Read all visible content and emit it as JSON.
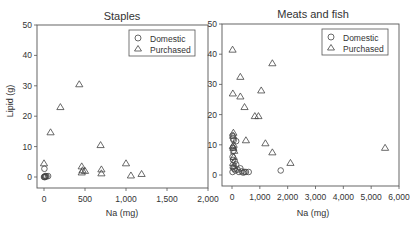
{
  "chart_data": [
    {
      "type": "scatter",
      "title": "Staples",
      "xlabel": "Na (mg)",
      "ylabel": "Lipid (g)",
      "xlim": [
        0,
        2000
      ],
      "ylim": [
        0,
        50
      ],
      "xticks": [
        "0",
        "500",
        "1,000",
        "1,500",
        "2,000"
      ],
      "yticks": [
        "0",
        "10",
        "20",
        "30",
        "40",
        "50"
      ],
      "grid": false,
      "legend": {
        "position": "upper right",
        "entries": [
          "Domestic",
          "Purchased"
        ]
      },
      "series": [
        {
          "name": "Domestic",
          "marker": "circle",
          "points": [
            [
              0,
              0
            ],
            [
              5,
              0
            ],
            [
              10,
              0.2
            ],
            [
              15,
              0
            ],
            [
              20,
              0.3
            ],
            [
              30,
              0.2
            ],
            [
              50,
              0.3
            ],
            [
              5,
              2.7
            ]
          ]
        },
        {
          "name": "Purchased",
          "marker": "triangle",
          "points": [
            [
              0,
              4.5
            ],
            [
              80,
              14.7
            ],
            [
              200,
              23
            ],
            [
              430,
              30.5
            ],
            [
              460,
              3.5
            ],
            [
              460,
              1.5
            ],
            [
              470,
              2.2
            ],
            [
              500,
              2
            ],
            [
              690,
              10.5
            ],
            [
              700,
              2.5
            ],
            [
              700,
              1.2
            ],
            [
              1000,
              4.5
            ],
            [
              1060,
              0.5
            ],
            [
              1190,
              1
            ]
          ]
        }
      ]
    },
    {
      "type": "scatter",
      "title": "Meats and fish",
      "xlabel": "Na (mg)",
      "ylabel": "",
      "xlim": [
        0,
        6000
      ],
      "ylim": [
        0,
        50
      ],
      "xticks": [
        "0",
        "1,000",
        "2,000",
        "3,000",
        "4,000",
        "5,000",
        "6,000"
      ],
      "yticks": [
        "0",
        "10",
        "20",
        "30",
        "40",
        "50"
      ],
      "grid": false,
      "legend": {
        "position": "upper right",
        "entries": [
          "Domestic",
          "Purchased"
        ]
      },
      "series": [
        {
          "name": "Domestic",
          "marker": "circle",
          "points": [
            [
              20,
              13
            ],
            [
              40,
              12
            ],
            [
              60,
              11.5
            ],
            [
              150,
              11.2
            ],
            [
              30,
              9
            ],
            [
              50,
              8
            ],
            [
              20,
              6
            ],
            [
              40,
              5
            ],
            [
              100,
              4.5
            ],
            [
              150,
              3.5
            ],
            [
              30,
              2.5
            ],
            [
              80,
              2
            ],
            [
              120,
              1.5
            ],
            [
              200,
              1.8
            ],
            [
              300,
              2.2
            ],
            [
              250,
              1
            ],
            [
              350,
              1.2
            ],
            [
              400,
              0.8
            ],
            [
              450,
              1
            ],
            [
              500,
              1
            ],
            [
              600,
              1
            ],
            [
              20,
              1
            ],
            [
              1750,
              1.5
            ]
          ]
        },
        {
          "name": "Purchased",
          "marker": "triangle",
          "points": [
            [
              20,
              41.5
            ],
            [
              1450,
              37
            ],
            [
              300,
              32.5
            ],
            [
              1050,
              28
            ],
            [
              30,
              27
            ],
            [
              300,
              26
            ],
            [
              450,
              22.5
            ],
            [
              820,
              19.5
            ],
            [
              950,
              19.5
            ],
            [
              50,
              14
            ],
            [
              40,
              13
            ],
            [
              60,
              10
            ],
            [
              30,
              9.5
            ],
            [
              50,
              9
            ],
            [
              80,
              8
            ],
            [
              60,
              6
            ],
            [
              40,
              4
            ],
            [
              70,
              3
            ],
            [
              500,
              11.5
            ],
            [
              1200,
              10.5
            ],
            [
              1450,
              7.5
            ],
            [
              2100,
              4
            ],
            [
              5500,
              9
            ]
          ]
        }
      ]
    }
  ],
  "panels": [
    {
      "title": "Staples",
      "xlabel": "Na (mg)",
      "ylabel": "Lipid (g)",
      "legend": {
        "domestic": "Domestic",
        "purchased": "Purchased"
      }
    },
    {
      "title": "Meats and fish",
      "xlabel": "Na (mg)",
      "legend": {
        "domestic": "Domestic",
        "purchased": "Purchased"
      }
    }
  ],
  "colors": {
    "frame": "#555555",
    "marker": "#444444",
    "text": "#333333"
  }
}
